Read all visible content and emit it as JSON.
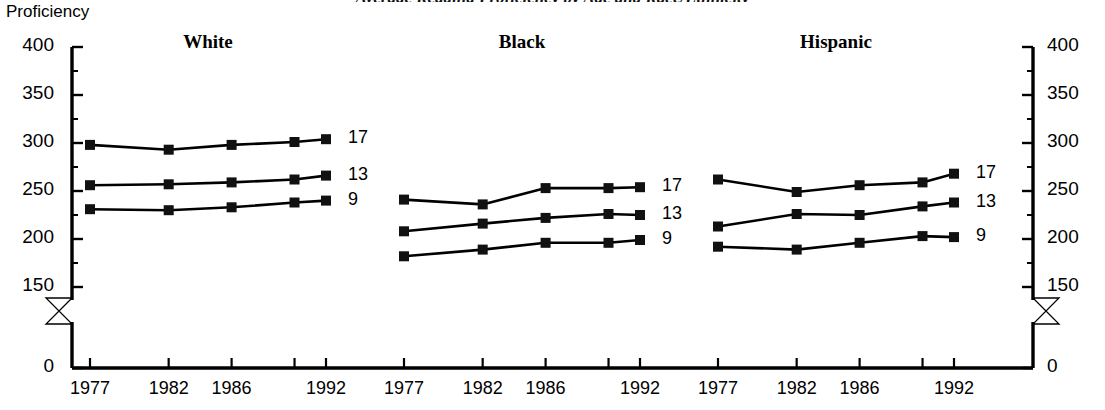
{
  "title": "Average Reading Proficiency by Age and Race/Ethnicity",
  "axis": {
    "y_title": "Proficiency",
    "y_ticks": [
      "400",
      "350",
      "300",
      "250",
      "200",
      "150",
      "0"
    ],
    "y_tick_values": [
      400,
      350,
      300,
      250,
      200,
      150,
      0
    ],
    "y_minor_count": 1,
    "axis_break": true,
    "x_tick_labels": [
      "1977",
      "1982",
      "1986",
      "1992"
    ]
  },
  "panels": [
    {
      "name": "White",
      "title": "White"
    },
    {
      "name": "Black",
      "title": "Black"
    },
    {
      "name": "Hispanic",
      "title": "Hispanic"
    }
  ],
  "series_labels": [
    "17",
    "13",
    "9"
  ],
  "chart_data": {
    "type": "line",
    "title": "Average Reading Proficiency by Age and Race/Ethnicity",
    "xlabel": "",
    "ylabel": "Proficiency",
    "ylim": [
      150,
      400
    ],
    "y_break_to_zero": true,
    "grid": false,
    "legend": "right of each panel (age labels 17, 13, 9)",
    "x": [
      1977,
      1982,
      1986,
      1990,
      1992
    ],
    "x_labeled": [
      1977,
      1982,
      1986,
      1992
    ],
    "marker": "filled square",
    "panels": [
      {
        "name": "White",
        "series": [
          {
            "name": "17",
            "values": [
              298,
              293,
              298,
              301,
              304
            ]
          },
          {
            "name": "13",
            "values": [
              256,
              257,
              259,
              262,
              266
            ]
          },
          {
            "name": "9",
            "values": [
              231,
              230,
              233,
              238,
              240
            ]
          }
        ]
      },
      {
        "name": "Black",
        "series": [
          {
            "name": "17",
            "values": [
              241,
              236,
              253,
              253,
              254
            ]
          },
          {
            "name": "13",
            "values": [
              208,
              216,
              222,
              226,
              225
            ]
          },
          {
            "name": "9",
            "values": [
              182,
              189,
              196,
              196,
              199
            ]
          }
        ]
      },
      {
        "name": "Hispanic",
        "series": [
          {
            "name": "17",
            "values": [
              262,
              249,
              256,
              259,
              268
            ]
          },
          {
            "name": "13",
            "values": [
              213,
              226,
              225,
              234,
              238
            ]
          },
          {
            "name": "9",
            "values": [
              192,
              189,
              196,
              203,
              202
            ]
          }
        ]
      }
    ]
  },
  "colors": {
    "ink": "#000000",
    "background": "#ffffff"
  }
}
